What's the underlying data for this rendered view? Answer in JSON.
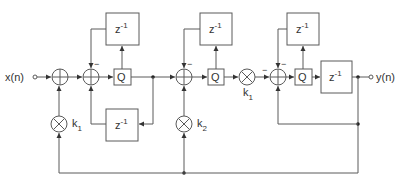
{
  "diagram": {
    "input_label": "x(n)",
    "output_label": "y(n)",
    "delay_label": "z",
    "delay_exp": "-1",
    "quantizer_label": "Q",
    "multiplier_k1": {
      "base": "k",
      "sub": "1"
    },
    "multiplier_k2": {
      "base": "k",
      "sub": "2"
    },
    "minus_sign": "−",
    "blocks": [
      {
        "id": "adder-1",
        "type": "adder"
      },
      {
        "id": "adder-2",
        "type": "adder"
      },
      {
        "id": "quantizer-1",
        "type": "quantizer",
        "label": "Q"
      },
      {
        "id": "delay-top-1",
        "type": "delay",
        "label": "z^-1"
      },
      {
        "id": "delay-bottom-1",
        "type": "delay",
        "label": "z^-1"
      },
      {
        "id": "multiplier-k1-left",
        "type": "multiplier",
        "label": "k1"
      },
      {
        "id": "adder-3",
        "type": "adder"
      },
      {
        "id": "quantizer-2",
        "type": "quantizer",
        "label": "Q"
      },
      {
        "id": "delay-top-2",
        "type": "delay",
        "label": "z^-1"
      },
      {
        "id": "multiplier-k2",
        "type": "multiplier",
        "label": "k2"
      },
      {
        "id": "multiplier-k1-mid",
        "type": "multiplier",
        "label": "k1"
      },
      {
        "id": "adder-4",
        "type": "adder"
      },
      {
        "id": "quantizer-3",
        "type": "quantizer",
        "label": "Q"
      },
      {
        "id": "delay-top-3",
        "type": "delay",
        "label": "z^-1"
      },
      {
        "id": "delay-output",
        "type": "delay",
        "label": "z^-1"
      }
    ]
  }
}
